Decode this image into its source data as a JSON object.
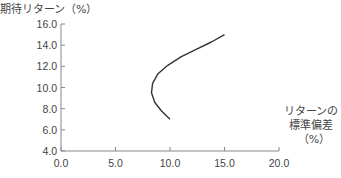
{
  "chart_data": {
    "type": "line",
    "title": "",
    "ylabel": "期待リターン（%）",
    "xlabel_lines": [
      "リターンの",
      "標準偏差",
      "（%）"
    ],
    "xlim": [
      0,
      20
    ],
    "ylim": [
      4,
      16
    ],
    "x_ticks": [
      "0.0",
      "5.0",
      "10.0",
      "15.0",
      "20.0"
    ],
    "y_ticks": [
      "4.0",
      "6.0",
      "8.0",
      "10.0",
      "12.0",
      "14.0",
      "16.0"
    ],
    "grid": false,
    "legend": null,
    "series": [
      {
        "name": "efficient frontier",
        "x": [
          10.0,
          9.2,
          8.6,
          8.3,
          8.4,
          8.9,
          9.8,
          11.0,
          12.4,
          13.8,
          15.0
        ],
        "y": [
          7.0,
          7.8,
          8.6,
          9.5,
          10.4,
          11.3,
          12.1,
          12.9,
          13.6,
          14.3,
          15.0
        ]
      }
    ],
    "line_color": "#333333"
  }
}
